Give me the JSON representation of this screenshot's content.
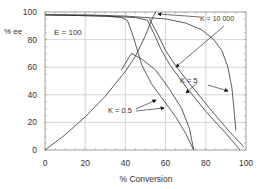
{
  "chart_data": {
    "type": "line",
    "title": "",
    "xlabel": "% Conversion",
    "ylabel": "% ee",
    "xlim": [
      0,
      100
    ],
    "ylim": [
      0,
      100
    ],
    "xticks": [
      0,
      20,
      40,
      60,
      80,
      100
    ],
    "yticks": [
      0,
      20,
      40,
      60,
      80,
      100
    ],
    "grid": true,
    "annotations": [
      {
        "text": "E = 100",
        "x": 4,
        "y": 80
      },
      {
        "text": "K = 10 000",
        "x": 77,
        "y": 96
      },
      {
        "text": "K = 5",
        "x": 63,
        "y": 59
      },
      {
        "text": "K = 0.5",
        "x": 14,
        "y": 23
      }
    ],
    "series": [
      {
        "name": "ee product (rising)",
        "points": [
          [
            0,
            0
          ],
          [
            10,
            11
          ],
          [
            20,
            24
          ],
          [
            30,
            39
          ],
          [
            40,
            57
          ],
          [
            45,
            68
          ],
          [
            50,
            83
          ],
          [
            53,
            94
          ],
          [
            55,
            100
          ]
        ]
      },
      {
        "name": "K = 10 000",
        "points": [
          [
            0,
            98
          ],
          [
            20,
            98
          ],
          [
            40,
            97
          ],
          [
            50,
            96
          ],
          [
            60,
            95
          ],
          [
            70,
            92
          ],
          [
            78,
            87
          ],
          [
            84,
            80
          ],
          [
            88,
            72
          ],
          [
            91,
            60
          ],
          [
            93,
            45
          ],
          [
            94,
            30
          ],
          [
            95,
            14
          ]
        ]
      },
      {
        "name": "K = 5 (a)",
        "points": [
          [
            0,
            98
          ],
          [
            30,
            97
          ],
          [
            45,
            96
          ],
          [
            51,
            94
          ],
          [
            54,
            85
          ],
          [
            58,
            72
          ],
          [
            62,
            62
          ],
          [
            70,
            46
          ],
          [
            80,
            28
          ],
          [
            90,
            12
          ],
          [
            97,
            0
          ]
        ]
      },
      {
        "name": "K = 5 (b)",
        "points": [
          [
            52,
            95
          ],
          [
            56,
            84
          ],
          [
            60,
            72
          ],
          [
            65,
            61
          ],
          [
            72,
            48
          ],
          [
            82,
            30
          ],
          [
            92,
            13
          ],
          [
            99,
            2
          ]
        ]
      },
      {
        "name": "K = 0.5 (a)",
        "points": [
          [
            0,
            98
          ],
          [
            30,
            97
          ],
          [
            38,
            96
          ],
          [
            41,
            94
          ],
          [
            44,
            82
          ],
          [
            48,
            62
          ],
          [
            53,
            48
          ],
          [
            58,
            38
          ],
          [
            65,
            24
          ],
          [
            70,
            12
          ],
          [
            74,
            0
          ]
        ]
      },
      {
        "name": "K = 0.5 (b)",
        "points": [
          [
            38,
            58
          ],
          [
            43,
            70
          ],
          [
            48,
            66
          ],
          [
            55,
            58
          ],
          [
            62,
            44
          ],
          [
            68,
            30
          ],
          [
            72,
            15
          ],
          [
            74,
            0
          ]
        ]
      }
    ]
  }
}
